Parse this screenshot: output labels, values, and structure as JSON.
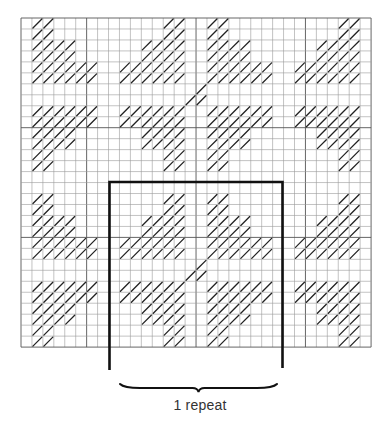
{
  "diagram": {
    "grid": {
      "cols": 32,
      "rows": 30,
      "origin_x": 21,
      "origin_y": 18,
      "cell_w": 10.94,
      "cell_h": 10.97,
      "line_color": "#9a9a9a",
      "major_line_color": "#555555",
      "major_cols": [
        6,
        16,
        26
      ],
      "major_rows": [
        10,
        20
      ],
      "hatch_color": "#222222"
    },
    "hatched_rows": [
      [
        1,
        2,
        13,
        14,
        17,
        18,
        29,
        30
      ],
      [
        1,
        2,
        13,
        14,
        17,
        18,
        29,
        30
      ],
      [
        1,
        2,
        3,
        4,
        11,
        12,
        13,
        14,
        17,
        18,
        19,
        20,
        27,
        28,
        29,
        30
      ],
      [
        1,
        2,
        3,
        4,
        11,
        12,
        13,
        14,
        17,
        18,
        19,
        20,
        27,
        28,
        29,
        30
      ],
      [
        1,
        2,
        3,
        4,
        5,
        6,
        9,
        10,
        11,
        12,
        13,
        14,
        17,
        18,
        19,
        20,
        21,
        22,
        25,
        26,
        27,
        28,
        29,
        30
      ],
      [
        1,
        2,
        3,
        4,
        5,
        6,
        9,
        10,
        11,
        12,
        13,
        14,
        17,
        18,
        19,
        20,
        21,
        22,
        25,
        26,
        27,
        28,
        29,
        30
      ],
      [
        16
      ],
      [
        15,
        16
      ],
      [
        1,
        2,
        3,
        4,
        5,
        6,
        9,
        10,
        11,
        12,
        13,
        14,
        17,
        18,
        19,
        20,
        21,
        22,
        25,
        26,
        27,
        28,
        29,
        30
      ],
      [
        1,
        2,
        3,
        4,
        5,
        6,
        9,
        10,
        11,
        12,
        13,
        14,
        17,
        18,
        19,
        20,
        21,
        22,
        25,
        26,
        27,
        28,
        29,
        30
      ],
      [
        1,
        2,
        3,
        4,
        11,
        12,
        13,
        14,
        17,
        18,
        19,
        20,
        27,
        28,
        29,
        30
      ],
      [
        1,
        2,
        3,
        4,
        11,
        12,
        13,
        14,
        17,
        18,
        19,
        20,
        27,
        28,
        29,
        30
      ],
      [
        1,
        2,
        13,
        14,
        17,
        18,
        29,
        30
      ],
      [
        1,
        2,
        13,
        14,
        17,
        18,
        29,
        30
      ],
      [],
      [],
      [
        1,
        2,
        13,
        14,
        17,
        18,
        29,
        30
      ],
      [
        1,
        2,
        13,
        14,
        17,
        18,
        29,
        30
      ],
      [
        1,
        2,
        3,
        4,
        11,
        12,
        13,
        14,
        17,
        18,
        19,
        20,
        27,
        28,
        29,
        30
      ],
      [
        1,
        2,
        3,
        4,
        11,
        12,
        13,
        14,
        17,
        18,
        19,
        20,
        27,
        28,
        29,
        30
      ],
      [
        1,
        2,
        3,
        4,
        5,
        6,
        9,
        10,
        11,
        12,
        13,
        14,
        17,
        18,
        19,
        20,
        21,
        22,
        25,
        26,
        27,
        28,
        29,
        30
      ],
      [
        1,
        2,
        3,
        4,
        5,
        6,
        9,
        10,
        11,
        12,
        13,
        14,
        17,
        18,
        19,
        20,
        21,
        22,
        25,
        26,
        27,
        28,
        29,
        30
      ],
      [
        16
      ],
      [
        15,
        16
      ],
      [
        1,
        2,
        3,
        4,
        5,
        6,
        9,
        10,
        11,
        12,
        13,
        14,
        17,
        18,
        19,
        20,
        21,
        22,
        25,
        26,
        27,
        28,
        29,
        30
      ],
      [
        1,
        2,
        3,
        4,
        5,
        6,
        9,
        10,
        11,
        12,
        13,
        14,
        17,
        18,
        19,
        20,
        21,
        22,
        25,
        26,
        27,
        28,
        29,
        30
      ],
      [
        1,
        2,
        3,
        4,
        11,
        12,
        13,
        14,
        17,
        18,
        19,
        20,
        27,
        28,
        29,
        30
      ],
      [
        1,
        2,
        3,
        4,
        11,
        12,
        13,
        14,
        17,
        18,
        19,
        20,
        27,
        28,
        29,
        30
      ],
      [
        1,
        2,
        13,
        14,
        17,
        18,
        29,
        30
      ],
      [
        1,
        2,
        13,
        14,
        17,
        18,
        29,
        30
      ]
    ],
    "repeat_box": {
      "left_x": 109.5,
      "right_x": 282.5,
      "top_y": 182,
      "left_bottom_y": 370,
      "right_bottom_y": 368,
      "stroke": "#111111",
      "stroke_width": 2.6
    },
    "brace": {
      "x1": 120,
      "x2": 277,
      "y": 388,
      "color": "#111111"
    },
    "caption": "1 repeat"
  }
}
